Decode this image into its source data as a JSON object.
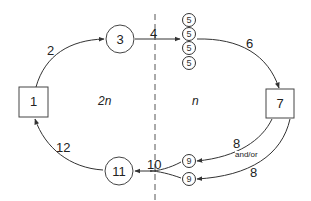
{
  "diagram": {
    "nodes": {
      "n1": {
        "label": "1",
        "shape": "square"
      },
      "n3": {
        "label": "3",
        "shape": "circle"
      },
      "n5": [
        {
          "label": "5",
          "shape": "small-circle"
        },
        {
          "label": "5",
          "shape": "small-circle"
        },
        {
          "label": "5",
          "shape": "small-circle"
        },
        {
          "label": "5",
          "shape": "small-circle"
        }
      ],
      "n7": {
        "label": "7",
        "shape": "square"
      },
      "n9": [
        {
          "label": "9",
          "shape": "small-circle"
        },
        {
          "label": "9",
          "shape": "small-circle"
        }
      ],
      "n11": {
        "label": "11",
        "shape": "circle"
      }
    },
    "edges": {
      "e2": "2",
      "e4": "4",
      "e6": "6",
      "e8a": "8",
      "e8b": "8",
      "and_or": "and/or",
      "e10": "10",
      "e12": "12"
    },
    "regions": {
      "left": "2n",
      "right": "n"
    },
    "colors": {
      "stroke": "#333333",
      "divider": "#555555",
      "background": "#ffffff"
    }
  }
}
